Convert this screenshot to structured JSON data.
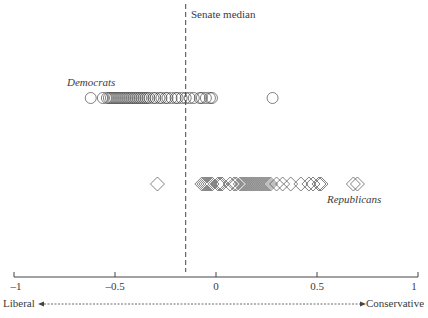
{
  "chart_data": {
    "type": "scatter",
    "title": "",
    "xlabel_left": "Liberal",
    "xlabel_right": "Conservative",
    "xlim": [
      -1,
      1
    ],
    "x_ticks": [
      -1,
      -0.5,
      0,
      0.5,
      1
    ],
    "x_tick_labels": [
      "–1",
      "–0.5",
      "0",
      "0.5",
      "1"
    ],
    "grid": false,
    "reference_line": {
      "label": "Senate median",
      "x": -0.15,
      "style": "dashed"
    },
    "series": [
      {
        "name": "Democrats",
        "marker": "circle",
        "row": "upper",
        "values": [
          -0.62,
          -0.56,
          -0.54,
          -0.53,
          -0.52,
          -0.51,
          -0.5,
          -0.49,
          -0.48,
          -0.47,
          -0.46,
          -0.45,
          -0.44,
          -0.43,
          -0.42,
          -0.41,
          -0.4,
          -0.39,
          -0.38,
          -0.37,
          -0.36,
          -0.35,
          -0.34,
          -0.33,
          -0.31,
          -0.3,
          -0.28,
          -0.27,
          -0.25,
          -0.24,
          -0.22,
          -0.2,
          -0.19,
          -0.17,
          -0.15,
          -0.13,
          -0.11,
          -0.08,
          -0.07,
          -0.05,
          -0.03,
          -0.02,
          0.28
        ]
      },
      {
        "name": "Republicans",
        "marker": "diamond",
        "row": "lower",
        "values": [
          -0.29,
          -0.07,
          -0.06,
          -0.05,
          -0.04,
          -0.03,
          -0.02,
          0.01,
          0.02,
          0.03,
          0.07,
          0.09,
          0.1,
          0.12,
          0.13,
          0.14,
          0.15,
          0.16,
          0.17,
          0.18,
          0.19,
          0.2,
          0.21,
          0.22,
          0.23,
          0.24,
          0.25,
          0.26,
          0.27,
          0.3,
          0.33,
          0.37,
          0.42,
          0.46,
          0.48,
          0.51,
          0.52,
          0.68,
          0.7
        ]
      }
    ]
  },
  "labels": {
    "median": "Senate median",
    "democrats": "Democrats",
    "republicans": "Republicans",
    "liberal": "Liberal",
    "conservative": "Conservative"
  }
}
